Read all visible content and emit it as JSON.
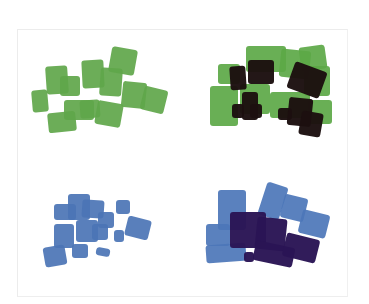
{
  "image": {
    "description": "Scanned sheet with four clusters of overlapping marker/paint swatches",
    "background": "#ffffff",
    "frame_border": "#ececec"
  },
  "panels": [
    {
      "name": "green-single",
      "position": "top-left",
      "colors": {
        "base": "#5fa64a"
      },
      "blobs": [
        {
          "x": 32,
          "y": 90,
          "w": 16,
          "h": 22,
          "r": -5,
          "c": "base"
        },
        {
          "x": 46,
          "y": 66,
          "w": 22,
          "h": 28,
          "r": -4,
          "c": "base"
        },
        {
          "x": 60,
          "y": 76,
          "w": 20,
          "h": 20,
          "r": 0,
          "c": "base"
        },
        {
          "x": 82,
          "y": 60,
          "w": 22,
          "h": 28,
          "r": -3,
          "c": "base"
        },
        {
          "x": 100,
          "y": 68,
          "w": 22,
          "h": 28,
          "r": 4,
          "c": "base"
        },
        {
          "x": 110,
          "y": 48,
          "w": 26,
          "h": 26,
          "r": 10,
          "c": "base"
        },
        {
          "x": 122,
          "y": 82,
          "w": 24,
          "h": 26,
          "r": 6,
          "c": "base"
        },
        {
          "x": 142,
          "y": 88,
          "w": 24,
          "h": 24,
          "r": 14,
          "c": "base"
        },
        {
          "x": 48,
          "y": 112,
          "w": 28,
          "h": 20,
          "r": -6,
          "c": "base"
        },
        {
          "x": 64,
          "y": 100,
          "w": 30,
          "h": 20,
          "r": 0,
          "c": "base"
        },
        {
          "x": 80,
          "y": 100,
          "w": 20,
          "h": 18,
          "r": -4,
          "c": "base"
        },
        {
          "x": 96,
          "y": 102,
          "w": 26,
          "h": 24,
          "r": 10,
          "c": "base"
        }
      ]
    },
    {
      "name": "green-with-dark-overlay",
      "position": "top-right",
      "colors": {
        "base": "#5ca847",
        "dark": "#1c0f10"
      },
      "blobs": [
        {
          "x": 218,
          "y": 64,
          "w": 22,
          "h": 20,
          "r": 0,
          "c": "base"
        },
        {
          "x": 246,
          "y": 46,
          "w": 40,
          "h": 26,
          "r": 0,
          "c": "base"
        },
        {
          "x": 280,
          "y": 50,
          "w": 30,
          "h": 28,
          "r": 6,
          "c": "base"
        },
        {
          "x": 300,
          "y": 46,
          "w": 26,
          "h": 24,
          "r": -8,
          "c": "base"
        },
        {
          "x": 304,
          "y": 66,
          "w": 26,
          "h": 30,
          "r": 0,
          "c": "base"
        },
        {
          "x": 210,
          "y": 86,
          "w": 28,
          "h": 40,
          "r": 0,
          "c": "base"
        },
        {
          "x": 240,
          "y": 84,
          "w": 30,
          "h": 30,
          "r": 0,
          "c": "base"
        },
        {
          "x": 270,
          "y": 92,
          "w": 40,
          "h": 26,
          "r": 0,
          "c": "base"
        },
        {
          "x": 308,
          "y": 100,
          "w": 24,
          "h": 24,
          "r": 0,
          "c": "base"
        },
        {
          "x": 230,
          "y": 66,
          "w": 16,
          "h": 24,
          "r": -4,
          "c": "dark"
        },
        {
          "x": 248,
          "y": 60,
          "w": 26,
          "h": 24,
          "r": 0,
          "c": "dark"
        },
        {
          "x": 290,
          "y": 66,
          "w": 34,
          "h": 28,
          "r": 20,
          "c": "dark"
        },
        {
          "x": 232,
          "y": 104,
          "w": 12,
          "h": 14,
          "r": 0,
          "c": "dark"
        },
        {
          "x": 242,
          "y": 92,
          "w": 16,
          "h": 28,
          "r": 0,
          "c": "dark"
        },
        {
          "x": 250,
          "y": 104,
          "w": 12,
          "h": 14,
          "r": 0,
          "c": "dark"
        },
        {
          "x": 278,
          "y": 108,
          "w": 14,
          "h": 12,
          "r": 0,
          "c": "dark"
        },
        {
          "x": 288,
          "y": 98,
          "w": 24,
          "h": 28,
          "r": 6,
          "c": "dark"
        },
        {
          "x": 300,
          "y": 112,
          "w": 22,
          "h": 24,
          "r": 10,
          "c": "dark"
        }
      ]
    },
    {
      "name": "blue-single",
      "position": "bottom-left",
      "colors": {
        "base": "#4b74b5"
      },
      "blobs": [
        {
          "x": 44,
          "y": 246,
          "w": 22,
          "h": 20,
          "r": -10,
          "c": "base"
        },
        {
          "x": 54,
          "y": 224,
          "w": 20,
          "h": 24,
          "r": 0,
          "c": "base"
        },
        {
          "x": 54,
          "y": 204,
          "w": 22,
          "h": 16,
          "r": 0,
          "c": "base"
        },
        {
          "x": 68,
          "y": 194,
          "w": 22,
          "h": 26,
          "r": 0,
          "c": "base"
        },
        {
          "x": 82,
          "y": 200,
          "w": 22,
          "h": 18,
          "r": 4,
          "c": "base"
        },
        {
          "x": 98,
          "y": 212,
          "w": 16,
          "h": 16,
          "r": 0,
          "c": "base"
        },
        {
          "x": 76,
          "y": 220,
          "w": 22,
          "h": 22,
          "r": 0,
          "c": "base"
        },
        {
          "x": 92,
          "y": 224,
          "w": 16,
          "h": 16,
          "r": 0,
          "c": "base"
        },
        {
          "x": 72,
          "y": 244,
          "w": 16,
          "h": 14,
          "r": 0,
          "c": "base"
        },
        {
          "x": 116,
          "y": 200,
          "w": 14,
          "h": 14,
          "r": 0,
          "c": "base"
        },
        {
          "x": 126,
          "y": 218,
          "w": 24,
          "h": 20,
          "r": 14,
          "c": "base"
        },
        {
          "x": 114,
          "y": 230,
          "w": 10,
          "h": 12,
          "r": 0,
          "c": "base"
        },
        {
          "x": 96,
          "y": 248,
          "w": 14,
          "h": 8,
          "r": 10,
          "c": "base"
        }
      ]
    },
    {
      "name": "blue-with-dark-overlay",
      "position": "bottom-right",
      "colors": {
        "base": "#4c76b8",
        "dark": "#2a1555"
      },
      "blobs": [
        {
          "x": 206,
          "y": 224,
          "w": 24,
          "h": 22,
          "r": 0,
          "c": "base"
        },
        {
          "x": 218,
          "y": 190,
          "w": 28,
          "h": 40,
          "r": 0,
          "c": "base"
        },
        {
          "x": 262,
          "y": 184,
          "w": 22,
          "h": 34,
          "r": 18,
          "c": "base"
        },
        {
          "x": 282,
          "y": 196,
          "w": 24,
          "h": 24,
          "r": 14,
          "c": "base"
        },
        {
          "x": 300,
          "y": 212,
          "w": 28,
          "h": 24,
          "r": 14,
          "c": "base"
        },
        {
          "x": 206,
          "y": 244,
          "w": 40,
          "h": 18,
          "r": -4,
          "c": "base"
        },
        {
          "x": 230,
          "y": 212,
          "w": 36,
          "h": 36,
          "r": 0,
          "c": "dark"
        },
        {
          "x": 256,
          "y": 218,
          "w": 30,
          "h": 32,
          "r": 6,
          "c": "dark"
        },
        {
          "x": 254,
          "y": 244,
          "w": 40,
          "h": 20,
          "r": 12,
          "c": "dark"
        },
        {
          "x": 284,
          "y": 236,
          "w": 34,
          "h": 24,
          "r": 14,
          "c": "dark"
        },
        {
          "x": 244,
          "y": 252,
          "w": 10,
          "h": 10,
          "r": 0,
          "c": "dark"
        }
      ]
    }
  ]
}
